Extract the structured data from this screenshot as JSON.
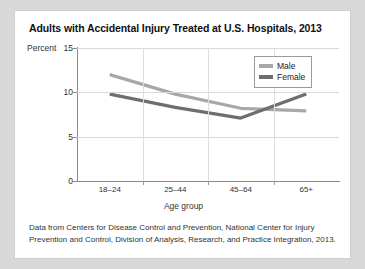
{
  "card": {
    "title": "Adults with Accidental Injury Treated at U.S. Hospitals, 2013",
    "footnote": "Data from Centers for Disease Control and Prevention, National Center for Injury Prevention and Control, Division of Analysis, Research, and Practice Integration, 2013."
  },
  "chart_data": {
    "type": "line",
    "title": "Adults with Accidental Injury Treated at U.S. Hospitals, 2013",
    "xlabel": "Age group",
    "ylabel": "Percent",
    "categories": [
      "18–24",
      "25–44",
      "45–64",
      "65+"
    ],
    "series": [
      {
        "name": "Male",
        "values": [
          12.0,
          9.8,
          8.2,
          7.9
        ],
        "color": "#a8a8a8"
      },
      {
        "name": "Female",
        "values": [
          9.8,
          8.3,
          7.1,
          9.8
        ],
        "color": "#6e6e6e"
      }
    ],
    "ylim": [
      0,
      15
    ],
    "yticks": [
      0,
      5,
      10,
      15
    ],
    "ytick_labels": [
      "0",
      "5",
      "10",
      "15"
    ],
    "grid": true,
    "legend_position": "top-right"
  },
  "colors": {
    "male_line": "#a8a8a8",
    "female_line": "#6e6e6e",
    "grid": "#d9d9d9",
    "axis": "#8a8a8a",
    "card_background": "#ffffff",
    "page_background": "#d8d8d8"
  }
}
